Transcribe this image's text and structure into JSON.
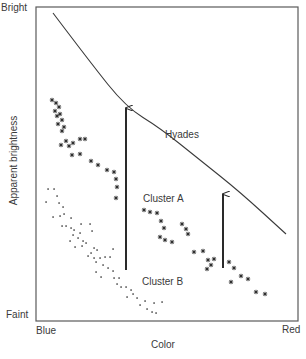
{
  "diagram": {
    "type": "color-magnitude diagram (main-sequence fitting)",
    "y_axis": {
      "label": "Apparent brightness",
      "top": "Bright",
      "bottom": "Faint"
    },
    "x_axis": {
      "label": "Color",
      "left": "Blue",
      "right": "Red"
    },
    "labels": {
      "hyades": "Hyades",
      "cluster_a": "Cluster A",
      "cluster_b": "Cluster B"
    },
    "colors": {
      "ink": "#3a3a3a",
      "frame": "#5a5a5a",
      "background": "#ffffff"
    },
    "hyades_curve": [
      [
        53,
        13
      ],
      [
        90,
        62
      ],
      [
        126,
        107
      ],
      [
        160,
        128
      ],
      [
        200,
        160
      ],
      [
        240,
        192
      ],
      [
        286,
        234
      ]
    ],
    "arrows": [
      {
        "name": "shift-arrow-cluster-b",
        "x": 126,
        "y_from": 270,
        "y_to": 107
      },
      {
        "name": "shift-arrow-cluster-a",
        "x": 223,
        "y_from": 268,
        "y_to": 193
      }
    ],
    "cluster_a_stars": [
      [
        52,
        100
      ],
      [
        56,
        103
      ],
      [
        59,
        107
      ],
      [
        55,
        111
      ],
      [
        60,
        114
      ],
      [
        57,
        116
      ],
      [
        62,
        120
      ],
      [
        58,
        124
      ],
      [
        64,
        127
      ],
      [
        62,
        131
      ],
      [
        61,
        145
      ],
      [
        66,
        141
      ],
      [
        69,
        146
      ],
      [
        73,
        143
      ],
      [
        80,
        139
      ],
      [
        85,
        139
      ],
      [
        72,
        155
      ],
      [
        80,
        154
      ],
      [
        91,
        161
      ],
      [
        98,
        165
      ],
      [
        107,
        170
      ],
      [
        114,
        172
      ],
      [
        116,
        179
      ],
      [
        117,
        187
      ],
      [
        116,
        198
      ],
      [
        144,
        210
      ],
      [
        150,
        212
      ],
      [
        157,
        213
      ],
      [
        161,
        221
      ],
      [
        164,
        228
      ],
      [
        160,
        237
      ],
      [
        165,
        240
      ],
      [
        172,
        242
      ],
      [
        182,
        224
      ],
      [
        186,
        229
      ],
      [
        188,
        234
      ],
      [
        194,
        252
      ],
      [
        203,
        251
      ],
      [
        208,
        260
      ],
      [
        214,
        259
      ],
      [
        211,
        265
      ],
      [
        207,
        269
      ],
      [
        229,
        262
      ],
      [
        234,
        268
      ],
      [
        241,
        276
      ],
      [
        248,
        279
      ],
      [
        231,
        282
      ],
      [
        256,
        292
      ],
      [
        265,
        294
      ]
    ],
    "cluster_b_dots": [
      [
        48,
        189
      ],
      [
        54,
        189
      ],
      [
        57,
        196
      ],
      [
        46,
        202
      ],
      [
        59,
        203
      ],
      [
        63,
        207
      ],
      [
        53,
        217
      ],
      [
        60,
        216
      ],
      [
        64,
        214
      ],
      [
        71,
        218
      ],
      [
        62,
        226
      ],
      [
        66,
        226
      ],
      [
        71,
        228
      ],
      [
        74,
        230
      ],
      [
        81,
        224
      ],
      [
        90,
        224
      ],
      [
        73,
        235
      ],
      [
        80,
        233
      ],
      [
        70,
        241
      ],
      [
        78,
        238
      ],
      [
        83,
        241
      ],
      [
        92,
        231
      ],
      [
        75,
        247
      ],
      [
        82,
        246
      ],
      [
        86,
        243
      ],
      [
        94,
        248
      ],
      [
        91,
        253
      ],
      [
        97,
        250
      ],
      [
        88,
        256
      ],
      [
        94,
        258
      ],
      [
        100,
        258
      ],
      [
        105,
        257
      ],
      [
        96,
        262
      ],
      [
        110,
        257
      ],
      [
        113,
        249
      ],
      [
        103,
        265
      ],
      [
        108,
        268
      ],
      [
        113,
        271
      ],
      [
        96,
        272
      ],
      [
        101,
        277
      ],
      [
        114,
        278
      ],
      [
        119,
        278
      ],
      [
        117,
        284
      ],
      [
        121,
        287
      ],
      [
        126,
        287
      ],
      [
        131,
        290
      ],
      [
        127,
        297
      ],
      [
        133,
        294
      ],
      [
        137,
        298
      ],
      [
        140,
        305
      ],
      [
        145,
        301
      ],
      [
        147,
        309
      ],
      [
        152,
        312
      ],
      [
        156,
        313
      ],
      [
        154,
        303
      ],
      [
        162,
        302
      ]
    ]
  }
}
